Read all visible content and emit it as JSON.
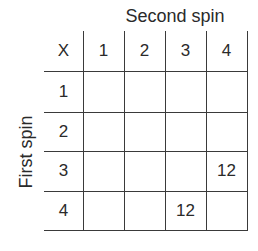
{
  "title": "Second spin",
  "row_axis_label": "First spin",
  "corner_label": "X",
  "column_headers": [
    "1",
    "2",
    "3",
    "4"
  ],
  "row_headers": [
    "1",
    "2",
    "3",
    "4"
  ],
  "cells": [
    [
      "",
      "",
      "",
      ""
    ],
    [
      "",
      "",
      "",
      ""
    ],
    [
      "",
      "",
      "",
      "12"
    ],
    [
      "",
      "",
      "12",
      ""
    ]
  ]
}
